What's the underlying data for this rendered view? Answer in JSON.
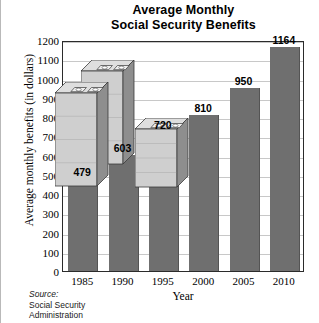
{
  "chart_data": {
    "type": "bar",
    "title": "Average Monthly Social Security Benefits",
    "title_line1": "Average Monthly",
    "title_line2": "Social Security Benefits",
    "xlabel": "Year",
    "ylabel": "Average monthly benefits (in dollars)",
    "categories": [
      "1985",
      "1990",
      "1995",
      "2000",
      "2005",
      "2010"
    ],
    "values": [
      479,
      603,
      720,
      810,
      950,
      1164
    ],
    "data_labels": [
      "479",
      "603",
      "720",
      "810",
      "950",
      "1164"
    ],
    "ylim": [
      0,
      1200
    ],
    "ytick_step": 100,
    "yticks": [
      "1200",
      "1100",
      "1000",
      "900",
      "800",
      "700",
      "600",
      "500",
      "400",
      "300",
      "200",
      "100",
      "0"
    ],
    "grid": "horizontal",
    "legend": "none",
    "bar_color": "#6f6f6f",
    "grid_color": "#c8c8c8",
    "frame_color": "#2b2b2b"
  },
  "source": {
    "label": "Source:",
    "line1": "Social Security",
    "line2": "Administration"
  },
  "decoration": {
    "name": "money-stacks-illustration",
    "description": "Three 3D stacks of banknote bundles",
    "top_face_color": "#dedede",
    "front_face_color": "#cfcfcf",
    "side_face_color": "#8e8e8e"
  }
}
